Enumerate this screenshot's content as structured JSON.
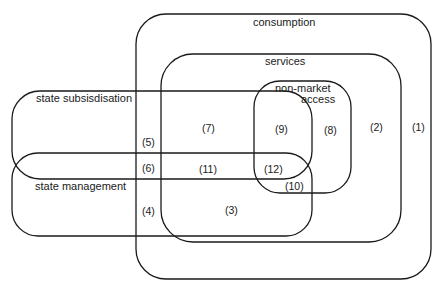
{
  "diagram": {
    "type": "nested-region-diagram",
    "sets": [
      {
        "id": "consumption",
        "label": "consumption"
      },
      {
        "id": "services",
        "label": "services"
      },
      {
        "id": "non_market_access",
        "label_line1": "non-market",
        "label_line2": "access"
      },
      {
        "id": "state_subsidisation",
        "label": "state subsisdisation"
      },
      {
        "id": "state_management",
        "label": "state management"
      }
    ],
    "regions": {
      "r1": "(1)",
      "r2": "(2)",
      "r3": "(3)",
      "r4": "(4)",
      "r5": "(5)",
      "r6": "(6)",
      "r7": "(7)",
      "r8": "(8)",
      "r9": "(9)",
      "r10": "(10)",
      "r11": "(11)",
      "r12": "(12)"
    },
    "stroke_color": "#1a1a1a",
    "background": "#ffffff"
  }
}
